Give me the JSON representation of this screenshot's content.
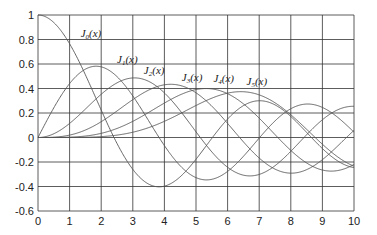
{
  "chart_data": {
    "type": "line",
    "title": "",
    "xlabel": "",
    "ylabel": "",
    "xlim": [
      0,
      10
    ],
    "ylim": [
      -0.6,
      1
    ],
    "grid": true,
    "x_ticks": [
      "0",
      "1",
      "2",
      "3",
      "4",
      "5",
      "6",
      "7",
      "8",
      "9",
      "10"
    ],
    "y_ticks": [
      "1",
      "0.8",
      "0.6",
      "0.4",
      "0.2",
      "0",
      "-0.2",
      "-0.4",
      "-0.6"
    ],
    "series": [
      {
        "name": "J0(x)",
        "label_main": "J",
        "label_sub": "0",
        "label_tail": "(x)",
        "order": 0,
        "label_pos": [
          1.35,
          0.82
        ]
      },
      {
        "name": "J1(x)",
        "label_main": "J",
        "label_sub": "1",
        "label_tail": "(x)",
        "order": 1,
        "label_pos": [
          2.5,
          0.61
        ]
      },
      {
        "name": "J2(x)",
        "label_main": "J",
        "label_sub": "2",
        "label_tail": "(x)",
        "order": 2,
        "label_pos": [
          3.35,
          0.52
        ]
      },
      {
        "name": "J3(x)",
        "label_main": "J",
        "label_sub": "3",
        "label_tail": "(x)",
        "order": 3,
        "label_pos": [
          4.55,
          0.46
        ]
      },
      {
        "name": "J4(x)",
        "label_main": "J",
        "label_sub": "4",
        "label_tail": "(x)",
        "order": 4,
        "label_pos": [
          5.55,
          0.45
        ]
      },
      {
        "name": "J5(x)",
        "label_main": "J",
        "label_sub": "5",
        "label_tail": "(x)",
        "order": 5,
        "label_pos": [
          6.6,
          0.43
        ]
      }
    ],
    "line_color": "#555555",
    "grid_color": "#333333"
  }
}
